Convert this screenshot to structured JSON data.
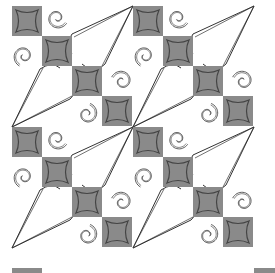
{
  "pattern": {
    "description": "Quilting block pattern: diagonal grey squares with curved inner borders, spiral swirls and elongated kite/star shapes",
    "colors": {
      "background": "#ffffff",
      "square_fill": "#8a8a8a",
      "square_stroke": "#444444",
      "line": "#333333"
    },
    "tile_size": 121,
    "origin": [
      12,
      6
    ],
    "grid": {
      "cols": 2,
      "rows": 2
    },
    "square_size": 30,
    "square_offsets": [
      [
        0,
        0
      ],
      [
        30,
        30
      ],
      [
        60,
        60
      ],
      [
        90,
        90
      ]
    ],
    "bottom_strip_y": 268
  }
}
